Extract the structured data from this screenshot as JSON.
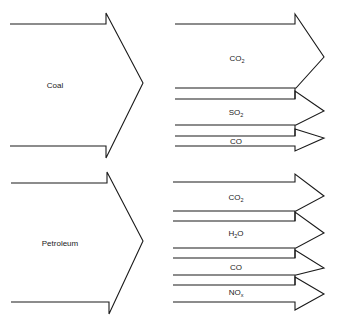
{
  "diagram": {
    "type": "fuel-emissions-flow",
    "stroke_color": "#1a1a1a",
    "sources": [
      {
        "label": "Coal",
        "outputs": [
          {
            "base": "CO",
            "sub": "2"
          },
          {
            "base": "SO",
            "sub": "2"
          },
          {
            "base": "CO",
            "sub": ""
          }
        ]
      },
      {
        "label": "Petroleum",
        "outputs": [
          {
            "base": "CO",
            "sub": "2"
          },
          {
            "base": "H",
            "sub": "2",
            "tail": "O"
          },
          {
            "base": "CO",
            "sub": ""
          },
          {
            "base": "NO",
            "sub": "x"
          }
        ]
      }
    ]
  }
}
